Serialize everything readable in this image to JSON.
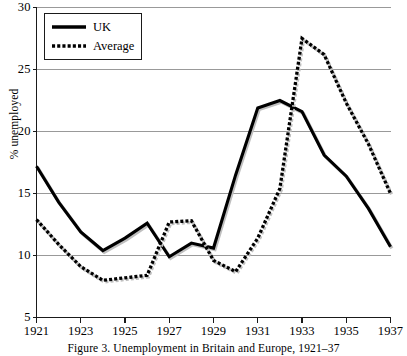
{
  "figure": {
    "caption": "Figure 3. Unemployment in Britain and Europe, 1921–37",
    "caption_label": "Figure 3.",
    "caption_title": "Unemployment in Britain and Europe, 1921–37"
  },
  "legend": {
    "position": "top-left",
    "entries": [
      {
        "label": "UK",
        "style": "solid",
        "color": "#000000"
      },
      {
        "label": "Average",
        "style": "dotted",
        "color": "#000000"
      }
    ]
  },
  "axes": {
    "y_title": "% unemployed",
    "y_ticks": [
      "5",
      "10",
      "15",
      "20",
      "25",
      "30"
    ],
    "x_ticks": [
      "1921",
      "1923",
      "1925",
      "1927",
      "1929",
      "1931",
      "1933",
      "1935",
      "1937"
    ]
  },
  "chart_data": {
    "type": "line",
    "title": "Unemployment in Britain and Europe, 1921–37",
    "xlabel": "",
    "ylabel": "% unemployed",
    "xlim": [
      1921,
      1937
    ],
    "ylim": [
      5,
      30
    ],
    "ytick_step": 5,
    "xtick_step": 2,
    "grid": "horizontal",
    "legend_position": "top-left",
    "x": [
      1921,
      1922,
      1923,
      1924,
      1925,
      1926,
      1927,
      1928,
      1929,
      1930,
      1931,
      1932,
      1933,
      1934,
      1935,
      1936,
      1937
    ],
    "series": [
      {
        "name": "UK",
        "style": "solid",
        "color": "#000000",
        "values": [
          17.2,
          14.3,
          11.9,
          10.4,
          11.4,
          12.6,
          9.9,
          11.0,
          10.6,
          16.5,
          21.9,
          22.5,
          21.6,
          18.1,
          16.4,
          13.8,
          10.7
        ]
      },
      {
        "name": "Average",
        "style": "dotted",
        "color": "#000000",
        "values": [
          12.9,
          10.9,
          9.1,
          8.0,
          8.2,
          8.4,
          12.7,
          12.8,
          9.6,
          8.7,
          11.4,
          15.4,
          27.5,
          26.2,
          22.3,
          19.0,
          15.0
        ]
      }
    ]
  },
  "style": {
    "grid_color": "#999999",
    "axis_color": "#1a1a1a",
    "background": "#ffffff"
  }
}
